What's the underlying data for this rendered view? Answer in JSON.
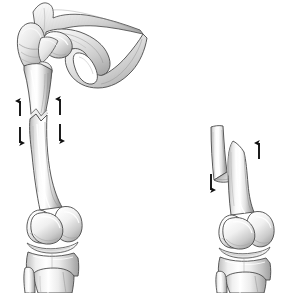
{
  "figure": {
    "kind": "medical-illustration",
    "background_color": "#ffffff",
    "width": 290,
    "height": 293,
    "title": "Femoral shaft fracture with displacement"
  },
  "palette": {
    "outline": "#3a3a3a",
    "bone_light": "#ffffff",
    "bone_mid": "#e3e3e3",
    "bone_shadow": "#a8a8a8",
    "bone_deep_shadow": "#7d7d7d",
    "cartilage": "#f2f2f2",
    "arrow": "#111111",
    "background": "#ffffff"
  },
  "panels": [
    {
      "id": "left-panel",
      "label": "Intact-length femur with transverse mid-shaft fracture",
      "parts": [
        {
          "name": "pelvis-ilium",
          "label": "Ilium"
        },
        {
          "name": "acetabulum",
          "label": "Acetabulum"
        },
        {
          "name": "obturator-foramen",
          "label": "Obturator foramen"
        },
        {
          "name": "pubis-ischium",
          "label": "Pubis and ischium"
        },
        {
          "name": "femoral-head",
          "label": "Femoral head"
        },
        {
          "name": "femoral-neck",
          "label": "Femoral neck"
        },
        {
          "name": "greater-trochanter",
          "label": "Greater trochanter"
        },
        {
          "name": "lesser-trochanter",
          "label": "Lesser trochanter"
        },
        {
          "name": "femoral-shaft-proximal",
          "label": "Proximal femoral shaft"
        },
        {
          "name": "fracture-line",
          "label": "Transverse fracture line"
        },
        {
          "name": "femoral-shaft-distal",
          "label": "Distal femoral shaft"
        },
        {
          "name": "medial-condyle",
          "label": "Medial femoral condyle"
        },
        {
          "name": "lateral-condyle",
          "label": "Lateral femoral condyle"
        },
        {
          "name": "patella",
          "label": "Patella"
        },
        {
          "name": "knee-joint-space",
          "label": "Knee joint space"
        },
        {
          "name": "tibial-plateau",
          "label": "Tibial plateau"
        },
        {
          "name": "tibia",
          "label": "Tibia"
        },
        {
          "name": "fibula",
          "label": "Fibula"
        }
      ],
      "arrows": [
        {
          "name": "arrow-proximal-medial-up",
          "direction": "up",
          "side": "medial"
        },
        {
          "name": "arrow-distal-medial-down",
          "direction": "down",
          "side": "medial"
        },
        {
          "name": "arrow-proximal-lateral-up",
          "direction": "up",
          "side": "lateral"
        },
        {
          "name": "arrow-distal-lateral-down",
          "direction": "down",
          "side": "lateral"
        }
      ]
    },
    {
      "id": "right-panel",
      "label": "Shortened femur with overriding oblique fracture",
      "parts": [
        {
          "name": "proximal-fragment",
          "label": "Proximal fragment"
        },
        {
          "name": "distal-fragment",
          "label": "Distal fragment"
        },
        {
          "name": "oblique-fracture-surface",
          "label": "Oblique fracture surface"
        },
        {
          "name": "override-overlap",
          "label": "Fragment override"
        },
        {
          "name": "medial-condyle",
          "label": "Medial femoral condyle"
        },
        {
          "name": "lateral-condyle",
          "label": "Lateral femoral condyle"
        },
        {
          "name": "patella",
          "label": "Patella"
        },
        {
          "name": "knee-joint-space",
          "label": "Knee joint space"
        },
        {
          "name": "tibial-plateau",
          "label": "Tibial plateau"
        },
        {
          "name": "tibia",
          "label": "Tibia"
        },
        {
          "name": "fibula",
          "label": "Fibula"
        }
      ],
      "arrows": [
        {
          "name": "arrow-proximal-fragment-down",
          "direction": "down",
          "side": "medial"
        },
        {
          "name": "arrow-distal-fragment-up",
          "direction": "up",
          "side": "lateral"
        }
      ]
    }
  ]
}
